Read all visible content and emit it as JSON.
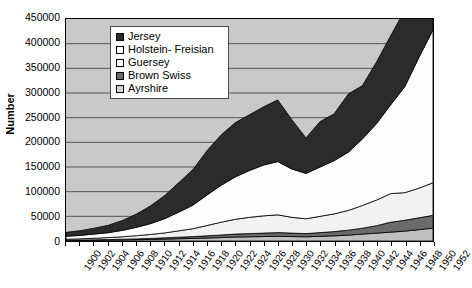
{
  "chart_data": {
    "type": "area",
    "stacked": true,
    "title": "",
    "xlabel": "",
    "ylabel": "Number",
    "ylim": [
      0,
      450000
    ],
    "ytick_step": 50000,
    "ytick_labels": [
      "450000",
      "400000",
      "350000",
      "300000",
      "250000",
      "200000",
      "150000",
      "100000",
      "50000",
      "0"
    ],
    "grid": true,
    "legend_position": "top-center",
    "plot_background": "#c9c9c9",
    "categories": [
      1900,
      1902,
      1904,
      1906,
      1908,
      1910,
      1912,
      1914,
      1916,
      1918,
      1920,
      1922,
      1924,
      1926,
      1928,
      1930,
      1932,
      1934,
      1936,
      1938,
      1940,
      1942,
      1944,
      1946,
      1948,
      1950,
      1952
    ],
    "x": [
      1900,
      1902,
      1904,
      1906,
      1908,
      1910,
      1912,
      1914,
      1916,
      1918,
      1920,
      1922,
      1924,
      1926,
      1928,
      1930,
      1932,
      1934,
      1936,
      1938,
      1940,
      1942,
      1944,
      1946,
      1948,
      1950,
      1952
    ],
    "stack_order_bottom_to_top": [
      "Ayrshire",
      "Brown Swiss",
      "Guersey",
      "Holstein- Freisian",
      "Jersey"
    ],
    "series": [
      {
        "name": "Ayrshire",
        "color": "#bfbfbf",
        "values": [
          1000,
          1200,
          1500,
          1800,
          2200,
          2600,
          3200,
          3800,
          4500,
          5200,
          6000,
          7000,
          8000,
          8500,
          9000,
          9500,
          9000,
          8500,
          9500,
          10500,
          12000,
          14000,
          16000,
          18000,
          20000,
          23000,
          26000
        ]
      },
      {
        "name": "Brown Swiss",
        "color": "#6b6b6b",
        "values": [
          500,
          700,
          900,
          1100,
          1400,
          1700,
          2100,
          2600,
          3200,
          3800,
          4500,
          5200,
          6000,
          6500,
          7000,
          7500,
          7000,
          6500,
          7500,
          8500,
          10000,
          12000,
          15000,
          20000,
          22000,
          24000,
          26000
        ]
      },
      {
        "name": "Guersey",
        "color": "#f2f2f2",
        "values": [
          2000,
          2500,
          3200,
          4000,
          5000,
          6500,
          8000,
          10000,
          13000,
          16000,
          21000,
          26000,
          30000,
          33000,
          35000,
          36000,
          32000,
          30000,
          33000,
          36000,
          40000,
          46000,
          52000,
          58000,
          56000,
          60000,
          66000
        ]
      },
      {
        "name": "Holstein- Freisian",
        "color": "#fdfdfd",
        "values": [
          6000,
          7000,
          8500,
          10000,
          13000,
          17000,
          22000,
          29000,
          38000,
          48000,
          62000,
          75000,
          86000,
          95000,
          103000,
          108000,
          98000,
          92000,
          100000,
          108000,
          118000,
          135000,
          155000,
          180000,
          215000,
          265000,
          310000
        ]
      },
      {
        "name": "Jersey",
        "color": "#2b2b2b",
        "values": [
          8000,
          9500,
          12000,
          15000,
          20000,
          27000,
          36000,
          47000,
          60000,
          72000,
          90000,
          102000,
          110000,
          113000,
          118000,
          125000,
          100000,
          72000,
          92000,
          95000,
          118000,
          108000,
          125000,
          140000,
          155000,
          165000,
          185000
        ]
      }
    ],
    "totals": [
      17500,
      20900,
      26100,
      31900,
      41600,
      54800,
      71300,
      92400,
      118700,
      145000,
      183500,
      215200,
      240000,
      256000,
      272000,
      286000,
      246000,
      209000,
      242000,
      258000,
      298000,
      315000,
      363000,
      416000,
      468000,
      537000,
      613000
    ]
  },
  "legend": {
    "items": [
      {
        "label": "Jersey",
        "swatch": "#2b2b2b"
      },
      {
        "label": "Holstein- Freisian",
        "swatch": "#ffffff"
      },
      {
        "label": "Guersey",
        "swatch": "#ffffff"
      },
      {
        "label": "Brown Swiss",
        "swatch": "#6b6b6b"
      },
      {
        "label": "Ayrshire",
        "swatch": "#d4d4d4"
      }
    ]
  },
  "axis": {
    "y_title": "Number",
    "y_ticks": [
      "450000",
      "400000",
      "350000",
      "300000",
      "250000",
      "200000",
      "150000",
      "100000",
      "50000",
      "0"
    ],
    "x_ticks": [
      "1900",
      "1902",
      "1904",
      "1906",
      "1908",
      "1910",
      "1912",
      "1914",
      "1916",
      "1918",
      "1920",
      "1922",
      "1924",
      "1926",
      "1928",
      "1930",
      "1932",
      "1934",
      "1936",
      "1938",
      "1940",
      "1942",
      "1944",
      "1946",
      "1948",
      "1950",
      "1952"
    ]
  }
}
